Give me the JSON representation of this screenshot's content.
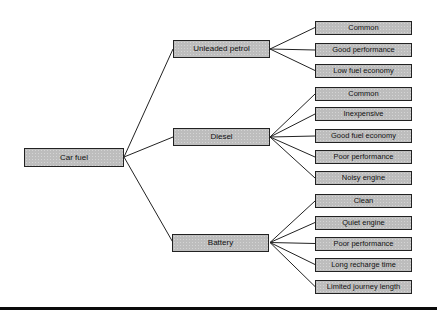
{
  "diagram": {
    "root": {
      "label": "Car fuel"
    },
    "branches": [
      {
        "label": "Unleaded petrol",
        "leaves": [
          "Common",
          "Good performance",
          "Low fuel economy"
        ]
      },
      {
        "label": "Diesel",
        "leaves": [
          "Common",
          "Inexpensive",
          "Good fuel economy",
          "Poor performance",
          "Noisy engine"
        ]
      },
      {
        "label": "Battery",
        "leaves": [
          "Clean",
          "Quiet engine",
          "Poor performance",
          "Long recharge time",
          "Limited journey length"
        ]
      }
    ],
    "colors": {
      "background": "#ffffff",
      "box_fill": "#bdbdbd",
      "box_border": "#222222",
      "connector_line": "#222222",
      "text": "#111111",
      "bottom_rule": "#0a0a0a"
    }
  }
}
